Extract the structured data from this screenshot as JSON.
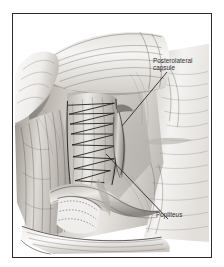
{
  "figure": {
    "kind": "surgical-illustration",
    "style": "grayscale pencil and ink medical illustration",
    "frame": {
      "border_color": "#2b2b2b",
      "background_color": "#ffffff",
      "page_background_color": "#ffffff"
    },
    "palette": {
      "ink_dark": "#1d1d1d",
      "ink_mid": "#6e6e6e",
      "tissue_light": "#f2f0ee",
      "tissue_mid": "#cfcbc6",
      "tissue_shadow": "#8f8a85",
      "deep_shadow": "#4a4642",
      "label_text": "#2e2e2e",
      "leader_line": "#2b2b2b"
    }
  },
  "labels": [
    {
      "id": "posterolateral-capsule",
      "text": "Posterolateral\ncapsule",
      "leader": {
        "x1": 167,
        "y1": 72,
        "x2": 122,
        "y2": 126
      }
    },
    {
      "id": "popliteus",
      "text": "Popliteus",
      "leader": {
        "x1": 168,
        "y1": 219,
        "x2": 106,
        "y2": 154
      }
    }
  ],
  "anatomy": {
    "structures": [
      "retracted muscle flap",
      "posterolateral capsule",
      "popliteus tendon",
      "suture repair ladder",
      "retracted skin edge",
      "fascial fibers",
      "cut bone edge"
    ],
    "suture_rows": 9
  }
}
